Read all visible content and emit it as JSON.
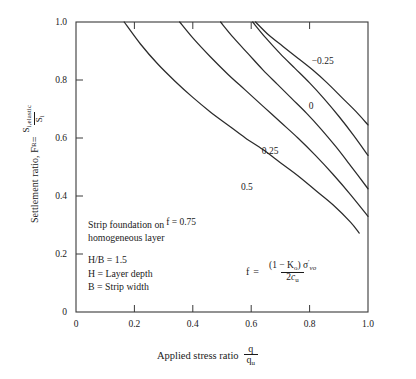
{
  "chart_data": {
    "type": "line",
    "title": "",
    "xlabel": "Applied stress ratio q/qu",
    "ylabel": "Settlement ratio, FR = Si,elastic / Si",
    "xlim": [
      0,
      1.0
    ],
    "ylim": [
      0,
      1.0
    ],
    "grid": false,
    "legend_position": "inline-curve-labels",
    "x_ticks": [
      "0",
      "0.2",
      "0.4",
      "0.6",
      "0.8",
      "1.0"
    ],
    "x_tick_values": [
      0,
      0.2,
      0.4,
      0.6,
      0.8,
      1.0
    ],
    "y_ticks": [
      "0",
      "0.2",
      "0.4",
      "0.6",
      "0.8",
      "1.0"
    ],
    "y_tick_values": [
      0,
      0.2,
      0.4,
      0.6,
      0.8,
      1.0
    ],
    "series": [
      {
        "name": "f = 0.75",
        "label": "f = 0.75",
        "x": [
          0.165,
          0.22,
          0.28,
          0.34,
          0.4,
          0.46,
          0.52,
          0.58,
          0.64,
          0.7,
          0.76,
          0.82,
          0.88,
          0.94,
          0.97
        ],
        "y": [
          1.0,
          0.925,
          0.855,
          0.795,
          0.74,
          0.69,
          0.645,
          0.6,
          0.56,
          0.515,
          0.47,
          0.42,
          0.37,
          0.31,
          0.272
        ]
      },
      {
        "name": "f = 0.5",
        "label": "0.5",
        "x": [
          0.355,
          0.4,
          0.46,
          0.52,
          0.58,
          0.64,
          0.7,
          0.76,
          0.82,
          0.88,
          0.94,
          1.0
        ],
        "y": [
          1.0,
          0.945,
          0.88,
          0.82,
          0.765,
          0.71,
          0.655,
          0.6,
          0.54,
          0.475,
          0.405,
          0.33
        ]
      },
      {
        "name": "f = 0.25",
        "label": "0.25",
        "x": [
          0.495,
          0.54,
          0.59,
          0.64,
          0.69,
          0.74,
          0.79,
          0.84,
          0.89,
          0.94,
          1.0
        ],
        "y": [
          1.0,
          0.945,
          0.89,
          0.835,
          0.785,
          0.735,
          0.685,
          0.63,
          0.57,
          0.505,
          0.425
        ]
      },
      {
        "name": "f = 0",
        "label": "0",
        "x": [
          0.605,
          0.65,
          0.7,
          0.75,
          0.8,
          0.85,
          0.9,
          0.95,
          1.0
        ],
        "y": [
          1.0,
          0.945,
          0.89,
          0.84,
          0.79,
          0.735,
          0.675,
          0.61,
          0.54
        ]
      },
      {
        "name": "f = -0.25",
        "label": "−0.25",
        "x": [
          0.615,
          0.66,
          0.71,
          0.76,
          0.81,
          0.86,
          0.91,
          0.96,
          1.0
        ],
        "y": [
          1.0,
          0.955,
          0.915,
          0.875,
          0.835,
          0.79,
          0.74,
          0.69,
          0.645
        ]
      }
    ],
    "curve_labels": [
      {
        "text": "−0.25",
        "x": 0.845,
        "y": 0.855
      },
      {
        "text": "0",
        "x": 0.805,
        "y": 0.7
      },
      {
        "text": "0.25",
        "x": 0.665,
        "y": 0.545
      },
      {
        "text": "0.5",
        "x": 0.585,
        "y": 0.42
      },
      {
        "text": "f = 0.75",
        "x": 0.36,
        "y": 0.3
      }
    ],
    "annotations": {
      "note_line1": "Strip foundation on",
      "note_line2": "homogeneous layer",
      "note_line3": "H/B = 1.5",
      "note_line4": "H = Layer depth",
      "note_line5": "B = Strip width",
      "formula_lhs": "f =",
      "formula_numerator": "(1 − Kₒ) σ′ᵥₒ",
      "formula_denominator": "2cᵤ"
    }
  },
  "axes": {
    "y_title_prefix": "Settlement ratio, F",
    "y_title_sub": "R",
    "y_title_eq": " = ",
    "y_frac_num": "S",
    "y_frac_num_sub": "i,elastic",
    "y_frac_den": "S",
    "y_frac_den_sub": "i",
    "x_title": "Applied stress ratio",
    "x_frac_num": "q",
    "x_frac_den": "q",
    "x_frac_den_sub": "u"
  },
  "formula": {
    "f_symbol": "f",
    "equals": "=",
    "num_open": "(1 − K",
    "num_ko_sub": "o",
    "num_close": ") σ",
    "num_prime": "′",
    "num_vo_sub": "vo",
    "den_two": "2",
    "den_c": "c",
    "den_u_sub": "u"
  },
  "colors": {
    "background": "#ffffff",
    "axis": "#3a3a3a",
    "curve": "#2b2b2b",
    "text": "#1a1a1a"
  }
}
